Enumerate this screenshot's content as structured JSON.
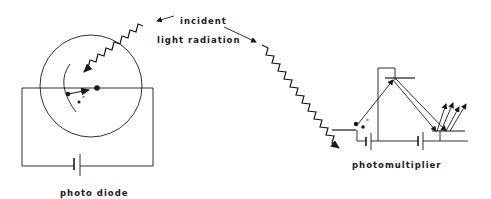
{
  "diagram": {
    "labels": {
      "incident": "incident",
      "light_radiation": "light radiation",
      "photo_diode": "photo diode",
      "photomultiplier": "photomultiplier",
      "electron_left": "-",
      "electron_right": "-"
    },
    "colors": {
      "ink": "#1a1a1a",
      "background": "#ffffff"
    }
  }
}
